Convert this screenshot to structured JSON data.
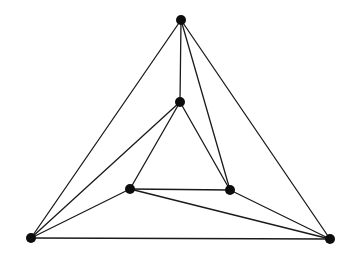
{
  "diagram": {
    "type": "planar-graph",
    "colors": {
      "edge": "#1a1a1a",
      "vertex": "#0d0d0d",
      "background": "#ffffff"
    },
    "vertex_radius": 5,
    "vertices": [
      {
        "id": "top",
        "x": 181,
        "y": 20
      },
      {
        "id": "middle",
        "x": 180,
        "y": 102
      },
      {
        "id": "inner-left",
        "x": 130,
        "y": 189
      },
      {
        "id": "inner-right",
        "x": 230,
        "y": 190
      },
      {
        "id": "bottom-left",
        "x": 31,
        "y": 238
      },
      {
        "id": "bottom-right",
        "x": 330,
        "y": 239
      }
    ],
    "edges": [
      [
        "top",
        "bottom-left"
      ],
      [
        "top",
        "bottom-right"
      ],
      [
        "top",
        "middle"
      ],
      [
        "top",
        "inner-right"
      ],
      [
        "bottom-left",
        "bottom-right"
      ],
      [
        "bottom-left",
        "middle"
      ],
      [
        "bottom-left",
        "inner-left"
      ],
      [
        "middle",
        "inner-left"
      ],
      [
        "middle",
        "inner-right"
      ],
      [
        "inner-left",
        "inner-right"
      ],
      [
        "inner-left",
        "bottom-right"
      ],
      [
        "inner-right",
        "bottom-right"
      ]
    ]
  }
}
